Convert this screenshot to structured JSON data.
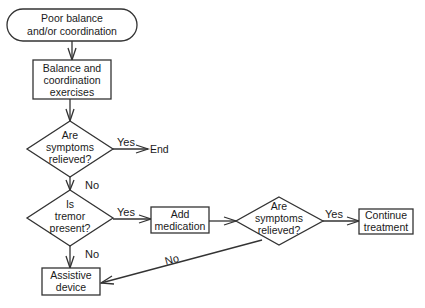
{
  "nodes": {
    "start": {
      "line1": "Poor balance",
      "line2": "and/or coordination"
    },
    "exercises": {
      "line1": "Balance and",
      "line2": "coordination",
      "line3": "exercises"
    },
    "decision1": {
      "line1": "Are",
      "line2": "symptoms",
      "line3": "relieved?"
    },
    "end": {
      "label": "End"
    },
    "decision2": {
      "line1": "Is",
      "line2": "tremor",
      "line3": "present?"
    },
    "medication": {
      "line1": "Add",
      "line2": "medication"
    },
    "decision3": {
      "line1": "Are",
      "line2": "symptoms",
      "line3": "relieved?"
    },
    "continue": {
      "line1": "Continue",
      "line2": "treatment"
    },
    "assistive": {
      "line1": "Assistive",
      "line2": "device"
    }
  },
  "edges": {
    "d1_yes": "Yes",
    "d1_no": "No",
    "d2_yes": "Yes",
    "d2_no": "No",
    "d3_yes": "Yes",
    "d3_no": "No"
  },
  "colors": {
    "stroke": "#333333",
    "text": "#1a1a1a",
    "background": "#ffffff"
  }
}
